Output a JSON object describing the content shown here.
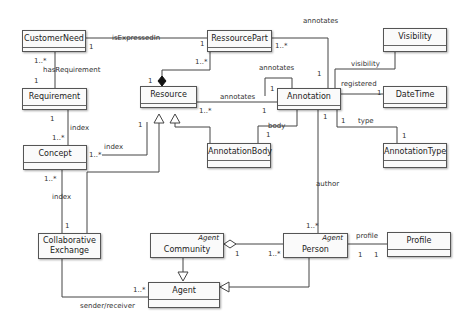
{
  "classes": {
    "customer_need": {
      "name": "CustomerNeed"
    },
    "ressource_part": {
      "name": "RessourcePart"
    },
    "visibility": {
      "name": "Visibility"
    },
    "requirement": {
      "name": "Requirement"
    },
    "resource": {
      "name": "Resource"
    },
    "annotation": {
      "name": "Annotation"
    },
    "date_time": {
      "name": "DateTime"
    },
    "concept": {
      "name": "Concept"
    },
    "annotation_body": {
      "name": "AnnotationBody"
    },
    "annotation_type": {
      "name": "AnnotationType"
    },
    "collaborative_exchange": {
      "name_line1": "Collaborative",
      "name_line2": "Exchange"
    },
    "community": {
      "stereotype": "Agent",
      "name": "Community"
    },
    "person": {
      "stereotype": "Agent",
      "name": "Person"
    },
    "profile": {
      "name": "Profile"
    },
    "agent": {
      "name": "Agent"
    }
  },
  "associations": {
    "is_expressed_in": {
      "label": "isExpressedIn",
      "mult_a": "1",
      "mult_b": "1"
    },
    "has_requirement": {
      "label": "hasRequirement",
      "mult_a": "1..*",
      "mult_b": "1"
    },
    "composition_part": {
      "mult_part": "1..*",
      "mult_whole": "1"
    },
    "part_annotates": {
      "label": "annotates",
      "mult_a": "1..*",
      "mult_b": "1"
    },
    "self_annotates": {
      "label": "annotates",
      "mult": "1"
    },
    "resource_annotates": {
      "label": "annotates",
      "mult_a": "1..*",
      "mult_b": "1"
    },
    "visibility": {
      "label": "visibility"
    },
    "registered": {
      "label": "registered",
      "mult": "1"
    },
    "type": {
      "label": "type",
      "mult_a": "1",
      "mult_b": "1"
    },
    "body": {
      "label": "body",
      "mult": "1"
    },
    "req_index": {
      "label": "index",
      "mult_a": "1",
      "mult_b": "1..*"
    },
    "concept_resource_index": {
      "label": "index",
      "mult_a": "1..*",
      "mult_b": "1"
    },
    "concept_exchange_index": {
      "label": "index",
      "mult_a": "1..*",
      "mult_b": "1"
    },
    "author": {
      "label": "author",
      "mult_a": "1",
      "mult_b": "1..*"
    },
    "exchange_mult": "1",
    "community_person": {
      "mult_a": "1",
      "mult_b": "1..*"
    },
    "profile": {
      "label": "profile",
      "mult_a": "1",
      "mult_b": "1"
    },
    "sender_receiver": {
      "label": "sender/receiver",
      "mult": "1..*"
    }
  }
}
